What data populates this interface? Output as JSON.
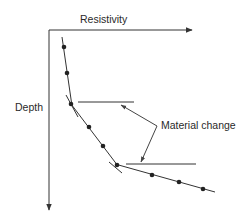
{
  "diagram": {
    "x_axis_label": "Resistivity",
    "y_axis_label": "Depth",
    "annotation": "Material change",
    "colors": {
      "line": "#333333",
      "point": "#222222",
      "background": "#ffffff"
    },
    "segments": [
      {
        "name": "layer-1",
        "points": [
          [
            64,
            47
          ],
          [
            67,
            73
          ],
          [
            71,
            104
          ]
        ]
      },
      {
        "name": "layer-2",
        "points": [
          [
            71,
            104
          ],
          [
            89,
            128
          ],
          [
            103,
            146
          ],
          [
            117,
            165
          ]
        ]
      },
      {
        "name": "layer-3",
        "points": [
          [
            117,
            165
          ],
          [
            152,
            175
          ],
          [
            179,
            182
          ],
          [
            203,
            189
          ]
        ]
      }
    ],
    "material_change_markers": [
      {
        "at": [
          71,
          104
        ],
        "line_y": 102
      },
      {
        "at": [
          117,
          165
        ],
        "line_y": 164
      }
    ]
  }
}
